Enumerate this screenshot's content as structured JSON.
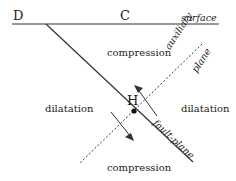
{
  "diagram": {
    "points": {
      "D": "D",
      "C": "C",
      "H": "H"
    },
    "labels": {
      "surface": "surface",
      "compression_top": "compression",
      "compression_bottom": "compression",
      "dilatation_left": "dilatation",
      "dilatation_right": "dilatation",
      "auxiliary": "auxiliary",
      "plane": "plane",
      "fault_plane": "fault-plane"
    }
  }
}
